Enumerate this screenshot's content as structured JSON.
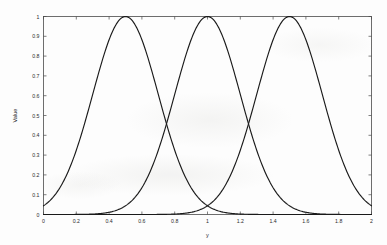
{
  "figure": {
    "background_color": "#fdfdfd",
    "frame_color": "#4a4a4a",
    "curve_color": "#1a1a1a"
  },
  "chart_data": {
    "type": "line",
    "title": "",
    "xlabel": "y",
    "ylabel": "Value",
    "xlim": [
      0,
      2
    ],
    "ylim": [
      0,
      1
    ],
    "grid": false,
    "legend": "none",
    "xticks": [
      0,
      0.2,
      0.4,
      0.6,
      0.8,
      1,
      1.2,
      1.4,
      1.6,
      1.8,
      2
    ],
    "xticklabels": [
      "0",
      "0.2",
      "0.4",
      "0.6",
      "0.8",
      "1",
      "1.2",
      "1.4",
      "1.6",
      "1.8",
      "2"
    ],
    "yticks": [
      0,
      0.1,
      0.2,
      0.3,
      0.4,
      0.5,
      0.6,
      0.7,
      0.8,
      0.9,
      1
    ],
    "yticklabels": [
      "0",
      "0.1",
      "0.2",
      "0.3",
      "0.4",
      "0.5",
      "0.6",
      "0.7",
      "0.8",
      "0.9",
      "1"
    ],
    "series": [
      {
        "name": "mf1",
        "center": 0.5,
        "peak": 1,
        "sigma": 0.2,
        "x": [
          0,
          0.05,
          0.1,
          0.15,
          0.2,
          0.25,
          0.3,
          0.35,
          0.4,
          0.45,
          0.5,
          0.55,
          0.6,
          0.65,
          0.7,
          0.75,
          0.8,
          0.85,
          0.9,
          0.95,
          1.0,
          1.1,
          1.2,
          1.4,
          1.6,
          1.8,
          2.0
        ],
        "values": [
          0.0439,
          0.0796,
          0.1353,
          0.2163,
          0.3247,
          0.4578,
          0.6065,
          0.7548,
          0.8825,
          0.9692,
          1.0,
          0.9692,
          0.8825,
          0.7548,
          0.6065,
          0.4578,
          0.3247,
          0.2163,
          0.1353,
          0.0796,
          0.0439,
          0.0111,
          0.0022,
          2e-05,
          0.0,
          0.0,
          0.0
        ]
      },
      {
        "name": "mf2",
        "center": 1.0,
        "peak": 1,
        "sigma": 0.2,
        "x": [
          0,
          0.2,
          0.4,
          0.5,
          0.55,
          0.6,
          0.65,
          0.7,
          0.75,
          0.8,
          0.85,
          0.9,
          0.95,
          1.0,
          1.05,
          1.1,
          1.15,
          1.2,
          1.25,
          1.3,
          1.35,
          1.4,
          1.45,
          1.5,
          1.6,
          1.8,
          2.0
        ],
        "values": [
          0.0,
          0.0022,
          0.0439,
          0.1353,
          0.2163,
          0.3247,
          0.4578,
          0.6065,
          0.7548,
          0.8825,
          0.9692,
          1.0,
          0.9692,
          1.0,
          0.9692,
          0.8825,
          0.7548,
          0.6065,
          0.4578,
          0.3247,
          0.2163,
          0.1353,
          0.0796,
          0.0439,
          0.0111,
          0.0002,
          0.0
        ]
      },
      {
        "name": "mf3",
        "center": 1.5,
        "peak": 1,
        "sigma": 0.2,
        "x": [
          0,
          0.2,
          0.4,
          0.6,
          0.8,
          0.9,
          1.0,
          1.05,
          1.1,
          1.15,
          1.2,
          1.25,
          1.3,
          1.35,
          1.4,
          1.45,
          1.5,
          1.55,
          1.6,
          1.65,
          1.7,
          1.75,
          1.8,
          1.85,
          1.9,
          1.95,
          2.0
        ],
        "values": [
          0.0,
          0.0,
          0.0,
          0.0022,
          0.0439,
          0.0796,
          0.1353,
          0.2163,
          0.3247,
          0.4578,
          0.6065,
          0.7548,
          0.8825,
          0.9692,
          1.0,
          0.9692,
          1.0,
          0.9692,
          0.8825,
          0.7548,
          0.6065,
          0.4578,
          0.3247,
          0.2163,
          0.1353,
          0.0796,
          0.0439
        ]
      }
    ],
    "crossings": [
      {
        "x": 0.75,
        "value": 0.34
      },
      {
        "x": 1.25,
        "value": 0.34
      }
    ]
  }
}
